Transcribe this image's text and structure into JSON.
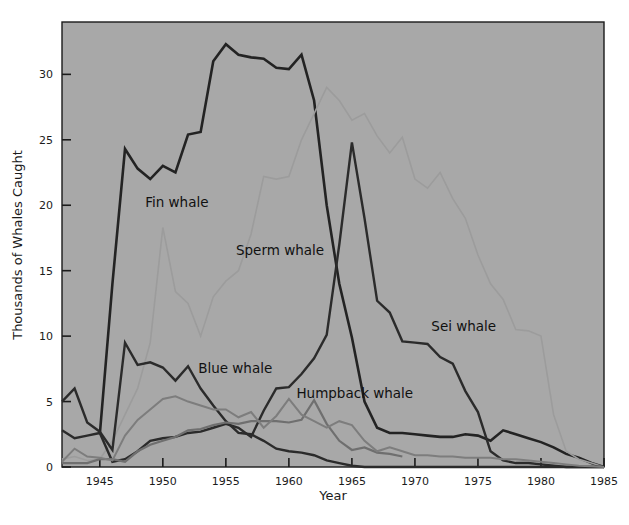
{
  "chart_data": {
    "type": "line",
    "title": "",
    "xlabel": "Year",
    "ylabel": "Thousands of Whales Caught",
    "xlim": [
      1942,
      1985
    ],
    "ylim": [
      0,
      34
    ],
    "xticks": [
      1945,
      1950,
      1955,
      1960,
      1965,
      1970,
      1975,
      1980,
      1985
    ],
    "xtick_labels": [
      "1945",
      "1950",
      "1955",
      "1960",
      "1965",
      "1970",
      "1975",
      "1980",
      "1985"
    ],
    "yticks": [
      0,
      5,
      10,
      15,
      20,
      25,
      30
    ],
    "ytick_labels": [
      "0",
      "5",
      "10",
      "15",
      "20",
      "25",
      "30"
    ],
    "grid": false,
    "legend_position": "inline-annotations",
    "background_color": "#a8a8a8",
    "x": [
      1942,
      1943,
      1944,
      1945,
      1946,
      1947,
      1948,
      1949,
      1950,
      1951,
      1952,
      1953,
      1954,
      1955,
      1956,
      1957,
      1958,
      1959,
      1960,
      1961,
      1962,
      1963,
      1964,
      1965,
      1966,
      1967,
      1968,
      1969,
      1970,
      1971,
      1972,
      1973,
      1974,
      1975,
      1976,
      1977,
      1978,
      1979,
      1980,
      1981,
      1982,
      1983,
      1984,
      1985
    ],
    "series": [
      {
        "name": "Fin whale",
        "color": "#232323",
        "width": 2.6,
        "label_x": 1948.6,
        "label_y": 19.9,
        "values": [
          null,
          null,
          null,
          2.5,
          14.0,
          24.3,
          22.8,
          22.0,
          23.0,
          22.5,
          25.4,
          25.6,
          31.0,
          32.3,
          31.5,
          31.3,
          31.2,
          30.5,
          30.4,
          31.5,
          28.0,
          20.0,
          14.0,
          9.9,
          5.0,
          3.0,
          2.6,
          2.6,
          2.5,
          2.4,
          2.3,
          2.3,
          2.5,
          2.4,
          2.0,
          2.8,
          2.5,
          2.2,
          1.9,
          1.5,
          1.0,
          0.7,
          0.3,
          0.0
        ]
      },
      {
        "name": "Sperm whale",
        "color": "#9c9c9c",
        "width": 1.6,
        "label_x": 1955.8,
        "label_y": 16.2,
        "values": [
          0.6,
          0.8,
          0.5,
          0.6,
          2.0,
          4.0,
          6.0,
          9.5,
          18.3,
          13.4,
          12.5,
          10.0,
          13.0,
          14.2,
          15.0,
          17.8,
          22.2,
          22.0,
          22.2,
          25.0,
          27.0,
          29.0,
          28.0,
          26.5,
          27.0,
          25.3,
          24.0,
          25.2,
          22.0,
          21.3,
          22.5,
          20.5,
          19.0,
          16.2,
          14.0,
          12.8,
          10.5,
          10.4,
          10.0,
          4.0,
          1.2,
          0.6,
          0.3,
          0.0
        ]
      },
      {
        "name": "Blue whale",
        "color": "#2b2b2b",
        "width": 2.4,
        "label_x": 1952.8,
        "label_y": 7.2,
        "values": [
          5.0,
          6.0,
          3.4,
          2.7,
          1.3,
          9.5,
          7.8,
          8.0,
          7.6,
          6.6,
          7.7,
          6.0,
          4.7,
          3.5,
          2.6,
          2.5,
          2.0,
          1.4,
          1.2,
          1.1,
          0.9,
          0.5,
          0.3,
          0.1,
          0.0,
          0.0,
          0.0,
          0.0,
          0.0,
          0.0,
          0.0,
          0.0,
          0.0,
          0.0,
          0.0,
          0.0,
          0.0,
          0.0,
          0.0,
          0.0,
          0.0,
          0.0,
          0.0,
          0.0
        ]
      },
      {
        "name": "Sei whale",
        "color": "#2b2b2b",
        "width": 2.4,
        "label_x": 1971.3,
        "label_y": 10.4,
        "values": [
          2.8,
          2.2,
          2.4,
          2.6,
          0.4,
          0.6,
          1.2,
          2.0,
          2.2,
          2.3,
          2.6,
          2.7,
          3.0,
          3.3,
          3.0,
          2.3,
          4.3,
          6.0,
          6.1,
          7.1,
          8.3,
          10.1,
          17.0,
          24.8,
          19.0,
          12.7,
          11.8,
          9.6,
          9.5,
          9.4,
          8.4,
          7.9,
          5.8,
          4.2,
          1.2,
          0.5,
          0.3,
          0.3,
          0.2,
          0.1,
          0.0,
          0.0,
          0.0,
          0.0
        ]
      },
      {
        "name": "Humpback whale",
        "color": "#6f6f6f",
        "width": 2.2,
        "label_x": 1960.6,
        "label_y": 5.3,
        "values": [
          0.3,
          0.3,
          0.3,
          0.6,
          0.6,
          0.4,
          1.2,
          1.7,
          2.0,
          2.3,
          2.8,
          2.9,
          3.2,
          3.4,
          3.3,
          3.5,
          3.5,
          3.5,
          3.4,
          3.6,
          5.1,
          3.3,
          2.0,
          1.3,
          1.5,
          1.1,
          1.0,
          0.8,
          null,
          null,
          null,
          null,
          null,
          null,
          null,
          null,
          null,
          null,
          null,
          null,
          null,
          null,
          null,
          null
        ]
      },
      {
        "name": "Minke whale",
        "color": "#7d7d7d",
        "width": 2.0,
        "label_x": null,
        "label_y": null,
        "values": [
          0.4,
          1.4,
          0.8,
          0.7,
          0.5,
          2.4,
          3.6,
          4.4,
          5.2,
          5.4,
          5.0,
          4.7,
          4.4,
          4.4,
          3.8,
          4.2,
          3.0,
          3.9,
          5.2,
          4.0,
          3.5,
          3.0,
          3.5,
          3.2,
          2.0,
          1.2,
          1.5,
          1.2,
          0.9,
          0.9,
          0.8,
          0.8,
          0.7,
          0.7,
          0.7,
          0.6,
          0.6,
          0.5,
          0.4,
          0.3,
          0.2,
          0.1,
          0.05,
          0.0
        ]
      }
    ],
    "annotations": [
      {
        "text": "Fin whale",
        "x": 1948.6,
        "y": 19.9
      },
      {
        "text": "Sperm whale",
        "x": 1955.8,
        "y": 16.2
      },
      {
        "text": "Blue whale",
        "x": 1952.8,
        "y": 7.2
      },
      {
        "text": "Humpback whale",
        "x": 1960.6,
        "y": 5.3
      },
      {
        "text": "Sei whale",
        "x": 1971.3,
        "y": 10.4
      }
    ]
  }
}
